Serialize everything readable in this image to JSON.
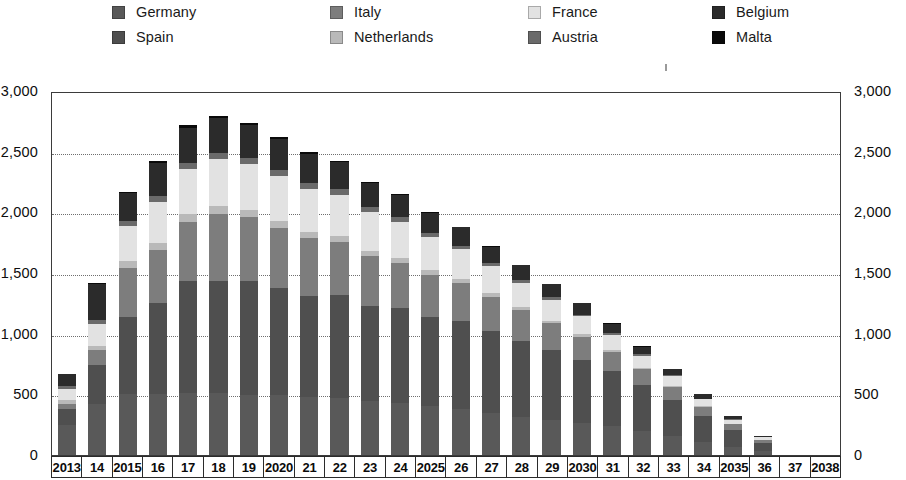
{
  "legend": {
    "items": [
      {
        "label": "Germany",
        "color": "#595959",
        "col": 0,
        "row": 0
      },
      {
        "label": "Spain",
        "color": "#4f4f4f",
        "col": 0,
        "row": 1
      },
      {
        "label": "Italy",
        "color": "#7d7d7d",
        "col": 1,
        "row": 0
      },
      {
        "label": "Netherlands",
        "color": "#b9b9b9",
        "col": 1,
        "row": 1
      },
      {
        "label": "France",
        "color": "#e2e2e2",
        "col": 2,
        "row": 0
      },
      {
        "label": "Austria",
        "color": "#6a6a6a",
        "col": 2,
        "row": 1
      },
      {
        "label": "Belgium",
        "color": "#2b2b2b",
        "col": 3,
        "row": 0
      },
      {
        "label": "Malta",
        "color": "#0a0a0a",
        "col": 3,
        "row": 1
      }
    ]
  },
  "axes": {
    "y_ticks": [
      "3,000",
      "2,500",
      "2,000",
      "1,500",
      "1,000",
      "500",
      "0"
    ],
    "y_tick_values": [
      3000,
      2500,
      2000,
      1500,
      1000,
      500,
      0
    ],
    "y_min": 0,
    "y_max": 3000,
    "x_labels": [
      "2013",
      "14",
      "2015",
      "16",
      "17",
      "18",
      "19",
      "2020",
      "21",
      "22",
      "23",
      "24",
      "2025",
      "26",
      "27",
      "28",
      "29",
      "2030",
      "31",
      "32",
      "33",
      "34",
      "2035",
      "36",
      "37",
      "2038"
    ]
  },
  "chart_data": {
    "type": "bar",
    "stacked": true,
    "title": "",
    "subtitle": "",
    "xlabel": "",
    "ylabel": "",
    "ylim": [
      0,
      3000
    ],
    "grid": true,
    "legend_position": "top",
    "categories": [
      "2013",
      "2014",
      "2015",
      "2016",
      "2017",
      "2018",
      "2019",
      "2020",
      "2021",
      "2022",
      "2023",
      "2024",
      "2025",
      "2026",
      "2027",
      "2028",
      "2029",
      "2030",
      "2031",
      "2032",
      "2033",
      "2034",
      "2035",
      "2036",
      "2037",
      "2038"
    ],
    "series": [
      {
        "name": "Germany",
        "color": "#595959",
        "values": [
          250,
          420,
          505,
          510,
          515,
          515,
          500,
          495,
          485,
          470,
          450,
          430,
          410,
          380,
          350,
          320,
          295,
          270,
          240,
          200,
          160,
          110,
          65,
          30,
          0,
          0
        ]
      },
      {
        "name": "Spain",
        "color": "#4f4f4f",
        "values": [
          130,
          330,
          640,
          755,
          930,
          930,
          945,
          890,
          840,
          860,
          790,
          790,
          740,
          730,
          680,
          630,
          575,
          520,
          455,
          380,
          300,
          215,
          140,
          70,
          0,
          0
        ]
      },
      {
        "name": "Italy",
        "color": "#7d7d7d",
        "values": [
          45,
          120,
          410,
          440,
          490,
          560,
          530,
          500,
          475,
          440,
          410,
          380,
          350,
          320,
          285,
          255,
          225,
          195,
          165,
          135,
          105,
          75,
          50,
          25,
          0,
          0
        ]
      },
      {
        "name": "Netherlands",
        "color": "#b9b9b9",
        "values": [
          30,
          40,
          55,
          60,
          65,
          65,
          60,
          60,
          55,
          50,
          45,
          40,
          35,
          32,
          28,
          25,
          22,
          18,
          15,
          12,
          10,
          8,
          5,
          3,
          0,
          0
        ]
      },
      {
        "name": "France",
        "color": "#e2e2e2",
        "values": [
          90,
          180,
          290,
          340,
          375,
          390,
          385,
          375,
          360,
          345,
          325,
          300,
          275,
          250,
          225,
          200,
          175,
          150,
          125,
          100,
          80,
          55,
          35,
          18,
          0,
          0
        ]
      },
      {
        "name": "Austria",
        "color": "#6a6a6a",
        "values": [
          25,
          35,
          45,
          50,
          52,
          52,
          50,
          48,
          45,
          42,
          38,
          35,
          32,
          28,
          25,
          22,
          18,
          15,
          12,
          10,
          8,
          6,
          4,
          2,
          0,
          0
        ]
      },
      {
        "name": "Belgium",
        "color": "#2b2b2b",
        "values": [
          100,
          300,
          235,
          270,
          295,
          290,
          275,
          260,
          245,
          225,
          205,
          190,
          170,
          155,
          140,
          125,
          110,
          95,
          80,
          65,
          50,
          35,
          22,
          10,
          0,
          0
        ]
      },
      {
        "name": "Malta",
        "color": "#0a0a0a",
        "values": [
          5,
          5,
          10,
          15,
          18,
          18,
          15,
          12,
          10,
          8,
          7,
          5,
          5,
          4,
          3,
          3,
          2,
          2,
          2,
          1,
          1,
          1,
          1,
          1,
          0,
          0
        ]
      }
    ],
    "totals": [
      675,
      1430,
      2190,
      2440,
      2540,
      2570,
      2520,
      2450,
      2385,
      2300,
      2190,
      2115,
      2015,
      1900,
      1780,
      1650,
      1505,
      1350,
      1180,
      1010,
      825,
      615,
      395,
      180,
      0,
      0
    ]
  }
}
